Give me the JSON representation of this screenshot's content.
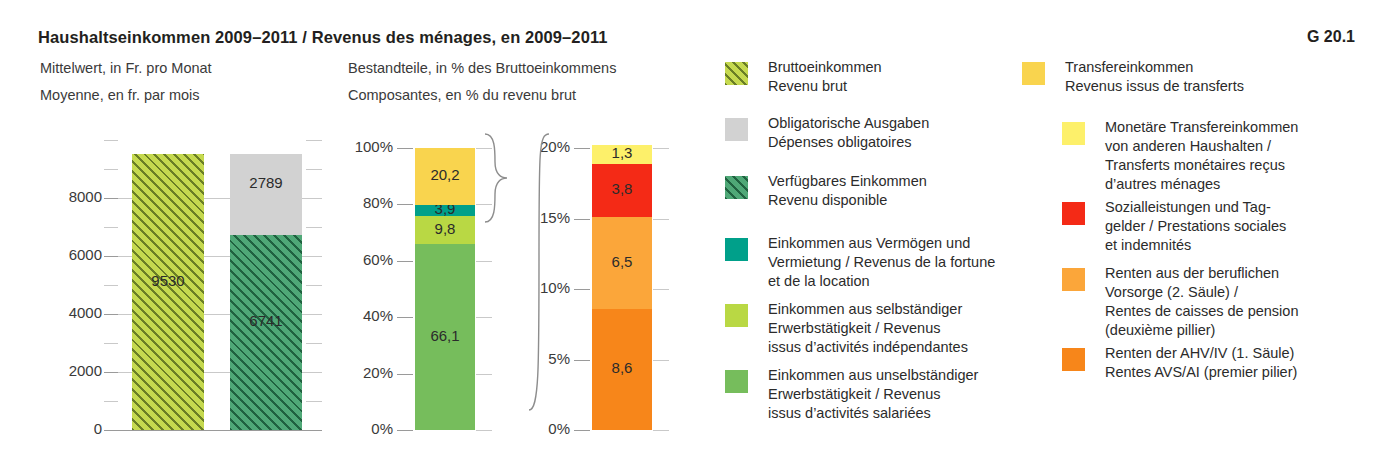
{
  "header": {
    "title": "Haushaltseinkommen 2009–2011 / Revenus des ménages, en 2009–2011",
    "figure_number": "G 20.1",
    "subtitle_left_de": "Mittelwert, in Fr. pro Monat",
    "subtitle_left_fr": "Moyenne, en fr. par mois",
    "subtitle_right_de": "Bestandteile, in % des Bruttoeinkommens",
    "subtitle_right_fr": "Composantes, en % du revenu brut"
  },
  "colors": {
    "gross_income": "#c5d94f",
    "mandatory_expenses": "#d2d2d2",
    "disposable_income": "#4fa877",
    "wealth_rental": "#00a08a",
    "self_employed": "#b9d844",
    "employed": "#76bd5c",
    "transfer_income": "#f9d44e",
    "monetary_transfers": "#fdf06a",
    "social_benefits": "#f42a16",
    "occupational_pension": "#fba63a",
    "ahv_iv_pension": "#f7861a",
    "gridline": "#c9c9c9",
    "axis": "#9a9a9a",
    "text": "#231f20"
  },
  "chart_data": [
    {
      "type": "bar",
      "id": "mean-income-chf",
      "title": "Mittelwert, in Fr. pro Monat",
      "ylabel": "",
      "xlabel": "",
      "ylim": [
        0,
        10000
      ],
      "yticks": [
        0,
        2000,
        4000,
        6000,
        8000
      ],
      "ytick_labels": [
        "0",
        "2000",
        "4000",
        "6000",
        "8000"
      ],
      "minor_tick_step": 1000,
      "grid": true,
      "unit": "Fr. pro Monat",
      "bars": [
        {
          "name": "Bruttoeinkommen / Revenu brut",
          "stacked": false,
          "segments": [
            {
              "label": "Bruttoeinkommen",
              "value": 9530,
              "display": "9530",
              "color_key": "gross_income",
              "pattern": "hatched"
            }
          ]
        },
        {
          "name": "Verfügbares Einkommen + Obligatorische Ausgaben",
          "stacked": true,
          "segments": [
            {
              "label": "Verfügbares Einkommen",
              "value": 6741,
              "display": "6741",
              "color_key": "disposable_income",
              "pattern": "hatched"
            },
            {
              "label": "Obligatorische Ausgaben",
              "value": 2789,
              "display": "2789",
              "color_key": "mandatory_expenses",
              "pattern": "solid"
            }
          ]
        }
      ]
    },
    {
      "type": "bar",
      "id": "components-percent",
      "title": "Bestandteile, in % des Bruttoeinkommens",
      "ylabel": "",
      "xlabel": "",
      "ylim": [
        0,
        100
      ],
      "yticks": [
        0,
        20,
        40,
        60,
        80,
        100
      ],
      "ytick_labels": [
        "0%",
        "20%",
        "40%",
        "60%",
        "80%",
        "100%"
      ],
      "minor_tick_step": 10,
      "grid": true,
      "unit": "% des Bruttoeinkommens",
      "stacked": true,
      "segments": [
        {
          "label": "Einkommen aus unselbständiger Erwerbstätigkeit",
          "value": 66.1,
          "display": "66,1",
          "color_key": "employed"
        },
        {
          "label": "Einkommen aus selbständiger Erwerbstätigkeit",
          "value": 9.8,
          "display": "9,8",
          "color_key": "self_employed"
        },
        {
          "label": "Einkommen aus Vermögen und Vermietung",
          "value": 3.9,
          "display": "3,9",
          "color_key": "wealth_rental"
        },
        {
          "label": "Transfereinkommen",
          "value": 20.2,
          "display": "20,2",
          "color_key": "transfer_income"
        }
      ]
    },
    {
      "type": "bar",
      "id": "transfer-income-detail",
      "title": "Transfereinkommen (Detail)",
      "ylabel": "",
      "xlabel": "",
      "ylim": [
        0,
        20
      ],
      "yticks": [
        0,
        5,
        10,
        15,
        20
      ],
      "ytick_labels": [
        "0%",
        "5%",
        "10%",
        "15%",
        "20%"
      ],
      "minor_tick_step": 5,
      "grid": true,
      "unit": "% des Bruttoeinkommens",
      "stacked": true,
      "segments": [
        {
          "label": "Renten der AHV/IV (1. Säule)",
          "value": 8.6,
          "display": "8,6",
          "color_key": "ahv_iv_pension"
        },
        {
          "label": "Renten aus der beruflichen Vorsorge (2. Säule)",
          "value": 6.5,
          "display": "6,5",
          "color_key": "occupational_pension"
        },
        {
          "label": "Sozialleistungen und Taggelder",
          "value": 3.8,
          "display": "3,8",
          "color_key": "social_benefits"
        },
        {
          "label": "Monetäre Transfereinkommen von anderen Haushalten",
          "value": 1.3,
          "display": "1,3",
          "color_key": "monetary_transfers"
        }
      ]
    }
  ],
  "legend": {
    "column_left": [
      {
        "swatch": "gross-income-swatch",
        "pattern": "hatched",
        "color_key": "gross_income",
        "text": "Bruttoeinkommen\nRevenu brut"
      },
      {
        "swatch": "mandatory-expenses-swatch",
        "pattern": "solid",
        "color_key": "mandatory_expenses",
        "text": "Obligatorische Ausgaben\nDépenses obligatoires"
      },
      {
        "swatch": "disposable-income-swatch",
        "pattern": "hatched",
        "color_key": "disposable_income",
        "text": "Verfügbares Einkommen\nRevenu disponible"
      },
      {
        "swatch": "wealth-rental-swatch",
        "pattern": "solid",
        "color_key": "wealth_rental",
        "text": "Einkommen aus Vermögen und\nVermietung / Revenus de la fortune\net de la location"
      },
      {
        "swatch": "self-employed-swatch",
        "pattern": "solid",
        "color_key": "self_employed",
        "text": "Einkommen aus selbständiger\nErwerbstätigkeit / Revenus\nissus d’activités indépendantes"
      },
      {
        "swatch": "employed-swatch",
        "pattern": "solid",
        "color_key": "employed",
        "text": "Einkommen aus unselbständiger\nErwerbstätigkeit / Revenus\nissus d’activités salariées"
      }
    ],
    "column_right": [
      {
        "swatch": "transfer-income-swatch",
        "pattern": "solid",
        "color_key": "transfer_income",
        "indent": false,
        "text": "Transfereinkommen\nRevenus issus de transferts"
      },
      {
        "swatch": "monetary-transfers-swatch",
        "pattern": "solid",
        "color_key": "monetary_transfers",
        "indent": true,
        "text": "Monetäre Transfereinkommen\nvon anderen Haushalten /\nTransferts monétaires reçus\nd’autres ménages"
      },
      {
        "swatch": "social-benefits-swatch",
        "pattern": "solid",
        "color_key": "social_benefits",
        "indent": true,
        "text": "Sozialleistungen und Tag-\ngelder / Prestations sociales\net indemnités"
      },
      {
        "swatch": "occupational-pension-swatch",
        "pattern": "solid",
        "color_key": "occupational_pension",
        "indent": true,
        "text": "Renten aus der beruflichen\nVorsorge (2. Säule) /\nRentes de caisses de pension\n(deuxième pillier)"
      },
      {
        "swatch": "ahv-iv-pension-swatch",
        "pattern": "solid",
        "color_key": "ahv_iv_pension",
        "indent": true,
        "text": "Renten der AHV/IV (1. Säule)\nRentes AVS/AI (premier pilier)"
      }
    ]
  }
}
